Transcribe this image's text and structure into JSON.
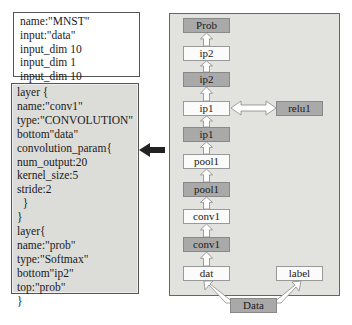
{
  "config": {
    "lines": [
      "name:\"MNST\"",
      "input:\"data\"",
      "input_dim 10",
      "input_dim 1",
      "input_dim 10"
    ]
  },
  "layer_def": {
    "lines": [
      "layer {",
      "name:\"conv1\"",
      "type:\"CONVOLUTION\"",
      "bottom\"data\"",
      "convolution_param{",
      "num_output:20",
      "kernel_size:5",
      "stride:2",
      "  }",
      "}",
      "layer{",
      "name:\"prob\"",
      "type:\"Softmax\"",
      "bottom\"ip2\"",
      "top:\"prob\"",
      "}"
    ]
  },
  "network": {
    "stack": [
      {
        "label": "Prob",
        "style": "dark"
      },
      {
        "label": "ip2",
        "style": "light"
      },
      {
        "label": "ip2",
        "style": "dark"
      },
      {
        "label": "ip1",
        "style": "light"
      },
      {
        "label": "ip1",
        "style": "dark"
      },
      {
        "label": "pool1",
        "style": "light"
      },
      {
        "label": "pool1",
        "style": "dark"
      },
      {
        "label": "conv1",
        "style": "light"
      },
      {
        "label": "conv1",
        "style": "dark"
      },
      {
        "label": "dat",
        "style": "light"
      }
    ],
    "relu": {
      "label": "relu1",
      "style": "dark"
    },
    "label_node": {
      "label": "label",
      "style": "light"
    },
    "data_node": {
      "label": "Data",
      "style": "dark"
    }
  }
}
